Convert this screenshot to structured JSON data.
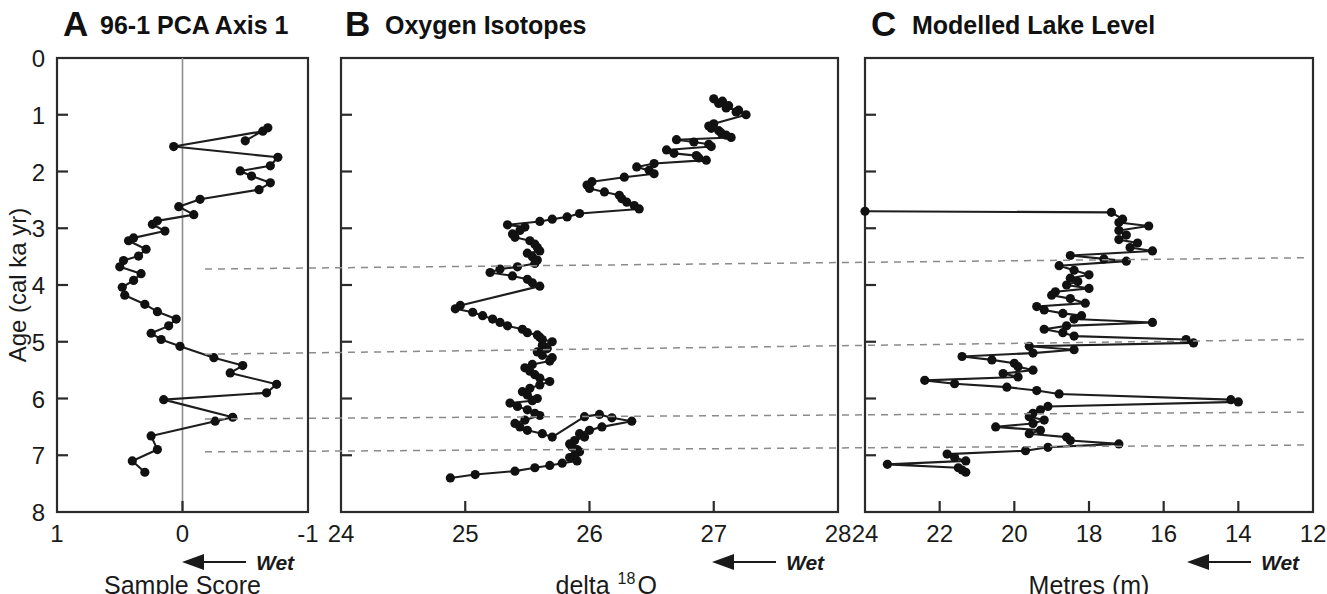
{
  "figure": {
    "width": 1327,
    "height": 594,
    "background": "#ffffff",
    "ink_color": "#111111",
    "dashed_color": "#8a8a8a",
    "y_axis_title": "Age (cal ka yr)",
    "y_axis_ticks": [
      "0",
      "1",
      "2",
      "3",
      "4",
      "5",
      "6",
      "7",
      "8"
    ],
    "wet_label": "Wet"
  },
  "chart_data": [
    {
      "type": "line",
      "panel": "A",
      "letter": "A",
      "title": "96-1 PCA Axis 1",
      "xlabel": "Sample Score",
      "ylabel": "Age (cal ka yr)",
      "xlim": [
        1,
        -1
      ],
      "ylim": [
        0,
        8
      ],
      "xticks": [
        1,
        0,
        -1
      ],
      "xtick_labels": [
        "1",
        "0",
        "-1"
      ],
      "yticks": [
        0,
        1,
        2,
        3,
        4,
        5,
        6,
        7,
        8
      ],
      "ytick_labels": [
        "0",
        "1",
        "2",
        "3",
        "4",
        "5",
        "6",
        "7",
        "8"
      ],
      "grid": false,
      "zero_reference_line": 0,
      "direction_annotation": "Wet",
      "direction_arrow": "left",
      "x": [
        -0.5,
        -0.68,
        -0.64,
        0.07,
        -0.76,
        -0.7,
        -0.46,
        -0.55,
        -0.7,
        -0.61,
        -0.14,
        0.03,
        -0.09,
        0.2,
        0.24,
        0.14,
        0.39,
        0.43,
        0.29,
        0.35,
        0.47,
        0.5,
        0.33,
        0.39,
        0.48,
        0.46,
        0.3,
        0.2,
        0.05,
        0.11,
        0.25,
        0.17,
        0.02,
        -0.25,
        -0.48,
        -0.38,
        -0.75,
        -0.67,
        0.15,
        -0.4,
        -0.26,
        0.25,
        0.2,
        0.4,
        0.3
      ],
      "y": [
        1.46,
        1.23,
        1.29,
        1.56,
        1.75,
        1.9,
        1.99,
        2.08,
        2.2,
        2.32,
        2.49,
        2.62,
        2.76,
        2.87,
        2.93,
        3.05,
        3.17,
        3.22,
        3.37,
        3.49,
        3.57,
        3.68,
        3.8,
        3.92,
        4.04,
        4.18,
        4.34,
        4.47,
        4.6,
        4.72,
        4.85,
        4.96,
        5.08,
        5.28,
        5.42,
        5.55,
        5.75,
        5.9,
        6.02,
        6.33,
        6.4,
        6.66,
        6.9,
        7.1,
        7.3
      ],
      "values_note": "Sample scores, plotted with x increasing leftward (1 at left, -1 at right)"
    },
    {
      "type": "line",
      "panel": "B",
      "letter": "B",
      "title": "Oxygen Isotopes",
      "xlabel": "delta18 O",
      "xlabel_base": "delta",
      "xlabel_sup": "18",
      "xlabel_tail": " O",
      "ylabel": "Age (cal ka yr)",
      "xlim": [
        24,
        28
      ],
      "ylim": [
        0,
        8
      ],
      "xticks": [
        24,
        25,
        26,
        27,
        28
      ],
      "xtick_labels": [
        "24",
        "25",
        "26",
        "27",
        "28"
      ],
      "yticks": [
        0,
        1,
        2,
        3,
        4,
        5,
        6,
        7,
        8
      ],
      "grid": false,
      "direction_annotation": "Wet",
      "direction_arrow": "left",
      "x": [
        27.0,
        27.07,
        27.04,
        27.12,
        27.1,
        27.2,
        27.18,
        27.26,
        27.0,
        26.96,
        26.98,
        27.04,
        27.06,
        27.1,
        27.14,
        26.7,
        26.84,
        26.96,
        26.98,
        26.62,
        26.68,
        26.86,
        26.88,
        26.94,
        26.52,
        26.38,
        26.48,
        26.52,
        26.28,
        26.02,
        25.98,
        26.0,
        26.12,
        26.24,
        26.26,
        26.3,
        26.36,
        26.4,
        25.92,
        25.82,
        25.7,
        25.6,
        25.34,
        25.48,
        25.44,
        25.38,
        25.4,
        25.52,
        25.56,
        25.58,
        25.6,
        25.5,
        25.54,
        25.58,
        25.56,
        25.42,
        25.28,
        25.2,
        25.38,
        25.5,
        25.54,
        25.6,
        24.96,
        24.92,
        25.06,
        25.14,
        25.22,
        25.28,
        25.34,
        25.46,
        25.5,
        25.58,
        25.6,
        25.62,
        25.7,
        25.62,
        25.66,
        25.58,
        25.62,
        25.7,
        25.68,
        25.54,
        25.48,
        25.52,
        25.56,
        25.6,
        25.68,
        25.6,
        25.52,
        25.46,
        25.5,
        25.58,
        25.54,
        25.36,
        25.42,
        25.5,
        25.56,
        25.6,
        25.48,
        25.4,
        25.44,
        25.5,
        25.62,
        25.7,
        25.96,
        26.08,
        26.18,
        26.34,
        26.1,
        26.0,
        25.92,
        25.96,
        25.88,
        25.84,
        25.86,
        25.9,
        25.92,
        25.88,
        25.84,
        25.9,
        25.78,
        25.68,
        25.56,
        25.4,
        25.08,
        24.88
      ],
      "y": [
        0.72,
        0.76,
        0.8,
        0.84,
        0.88,
        0.92,
        0.95,
        1.0,
        1.16,
        1.2,
        1.24,
        1.28,
        1.32,
        1.36,
        1.4,
        1.44,
        1.48,
        1.52,
        1.56,
        1.62,
        1.68,
        1.72,
        1.76,
        1.8,
        1.86,
        1.92,
        1.98,
        2.04,
        2.1,
        2.18,
        2.24,
        2.3,
        2.36,
        2.42,
        2.48,
        2.54,
        2.6,
        2.66,
        2.74,
        2.8,
        2.84,
        2.88,
        2.94,
        2.98,
        3.04,
        3.1,
        3.16,
        3.22,
        3.28,
        3.34,
        3.4,
        3.44,
        3.5,
        3.56,
        3.62,
        3.68,
        3.72,
        3.78,
        3.84,
        3.9,
        3.96,
        4.02,
        4.36,
        4.42,
        4.48,
        4.54,
        4.6,
        4.66,
        4.72,
        4.78,
        4.84,
        4.88,
        4.92,
        4.96,
        5.0,
        5.06,
        5.12,
        5.18,
        5.24,
        5.28,
        5.34,
        5.4,
        5.46,
        5.52,
        5.58,
        5.64,
        5.7,
        5.76,
        5.82,
        5.88,
        5.94,
        6.0,
        6.04,
        6.08,
        6.14,
        6.2,
        6.26,
        6.3,
        6.38,
        6.44,
        6.5,
        6.56,
        6.62,
        6.68,
        6.32,
        6.28,
        6.34,
        6.4,
        6.5,
        6.56,
        6.62,
        6.68,
        6.74,
        6.8,
        6.86,
        6.9,
        6.94,
        7.0,
        7.04,
        7.1,
        7.14,
        7.18,
        7.22,
        7.28,
        7.34,
        7.4
      ]
    },
    {
      "type": "line",
      "panel": "C",
      "letter": "C",
      "title": "Modelled Lake Level",
      "xlabel": "Metres (m)",
      "ylabel": "Age (cal ka yr)",
      "xlim": [
        24,
        12
      ],
      "ylim": [
        0,
        8
      ],
      "xticks": [
        24,
        22,
        20,
        18,
        16,
        14,
        12
      ],
      "xtick_labels": [
        "24",
        "22",
        "20",
        "18",
        "16",
        "14",
        "12"
      ],
      "yticks": [
        0,
        1,
        2,
        3,
        4,
        5,
        6,
        7,
        8
      ],
      "grid": false,
      "direction_annotation": "Wet",
      "direction_arrow": "left",
      "x": [
        24.0,
        17.4,
        17.1,
        17.2,
        16.4,
        17.2,
        17.0,
        17.2,
        16.7,
        16.9,
        16.3,
        18.5,
        17.6,
        17.0,
        18.8,
        18.4,
        18.0,
        18.5,
        18.3,
        18.6,
        18.0,
        18.9,
        19.0,
        18.5,
        18.1,
        19.4,
        19.2,
        18.7,
        18.2,
        18.4,
        16.3,
        18.6,
        19.2,
        18.7,
        18.4,
        15.4,
        15.2,
        19.6,
        18.4,
        19.5,
        21.4,
        20.6,
        20.0,
        19.9,
        19.5,
        20.3,
        19.9,
        22.4,
        21.6,
        20.2,
        19.4,
        18.8,
        14.2,
        14.0,
        19.1,
        19.3,
        19.5,
        19.6,
        19.2,
        19.5,
        20.5,
        19.3,
        19.6,
        18.6,
        18.5,
        17.2,
        19.1,
        19.7,
        21.8,
        21.6,
        21.3,
        23.4,
        21.5,
        21.4,
        21.3
      ],
      "y": [
        2.7,
        2.72,
        2.84,
        2.9,
        2.96,
        3.04,
        3.12,
        3.2,
        3.26,
        3.34,
        3.4,
        3.48,
        3.54,
        3.58,
        3.66,
        3.74,
        3.82,
        3.88,
        3.94,
        4.0,
        4.06,
        4.12,
        4.18,
        4.24,
        4.32,
        4.38,
        4.44,
        4.5,
        4.54,
        4.6,
        4.66,
        4.72,
        4.78,
        4.84,
        4.9,
        4.96,
        5.02,
        5.08,
        5.14,
        5.2,
        5.26,
        5.32,
        5.38,
        5.44,
        5.5,
        5.56,
        5.62,
        5.68,
        5.74,
        5.8,
        5.86,
        5.92,
        6.02,
        6.06,
        6.14,
        6.2,
        6.26,
        6.32,
        6.38,
        6.44,
        6.5,
        6.56,
        6.62,
        6.68,
        6.74,
        6.8,
        6.86,
        6.92,
        6.98,
        7.04,
        7.1,
        7.16,
        7.22,
        7.26,
        7.3
      ]
    }
  ],
  "correlation_lines": [
    {
      "name": "tie-line-1",
      "a_age": 3.72,
      "c_age": 3.52
    },
    {
      "name": "tie-line-2",
      "a_age": 5.22,
      "c_age": 4.96
    },
    {
      "name": "tie-line-3",
      "a_age": 6.36,
      "c_age": 6.24
    },
    {
      "name": "tie-line-4",
      "a_age": 6.94,
      "c_age": 6.82
    }
  ]
}
